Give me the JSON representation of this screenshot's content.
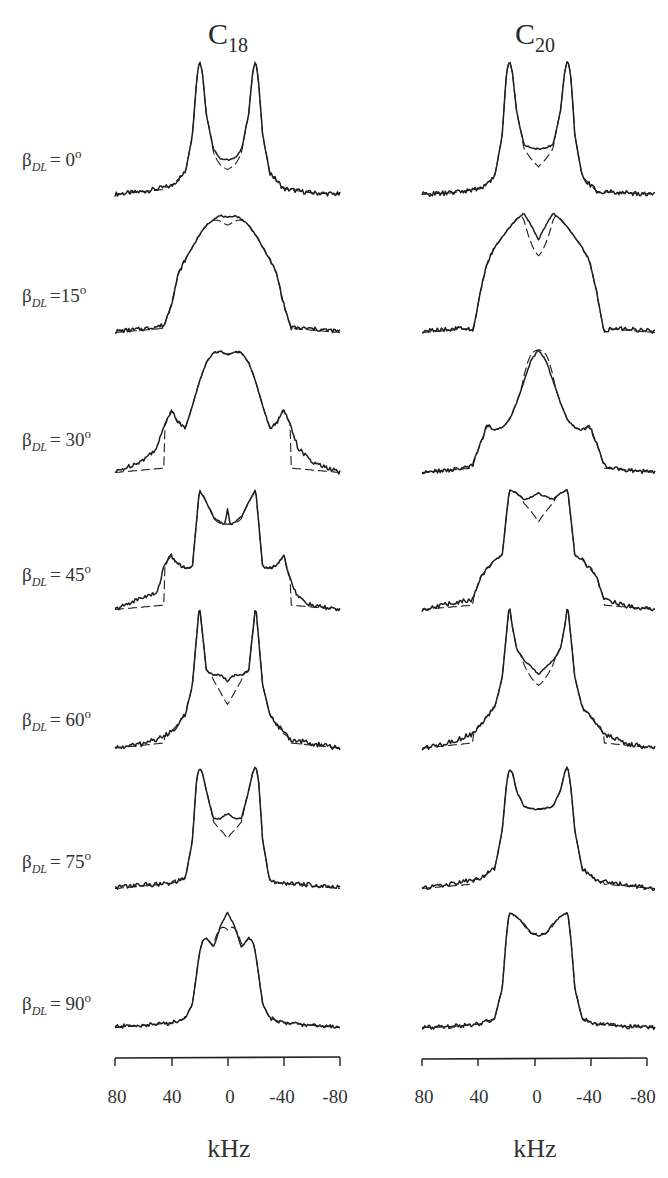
{
  "chart_data": {
    "type": "line",
    "title": "",
    "xlabel": "kHz",
    "ylabel": "",
    "xlim": [
      80,
      -80
    ],
    "x_ticks": [
      80,
      40,
      0,
      -40,
      -80
    ],
    "x_tick_labels": [
      "80",
      "40",
      "0",
      "-40",
      "-80"
    ],
    "grid": false,
    "legend": null,
    "columns": [
      {
        "id": "C18",
        "label": "C",
        "subscript": "18"
      },
      {
        "id": "C20",
        "label": "C",
        "subscript": "20"
      }
    ],
    "rows": [
      {
        "angle": 0,
        "label": "β",
        "subscript": "DL",
        "text": "= 0",
        "unit": "o"
      },
      {
        "angle": 15,
        "label": "β",
        "subscript": "DL",
        "text": "=15",
        "unit": "o"
      },
      {
        "angle": 30,
        "label": "β",
        "subscript": "DL",
        "text": "= 30",
        "unit": "o"
      },
      {
        "angle": 45,
        "label": "β",
        "subscript": "DL",
        "text": "= 45",
        "unit": "o"
      },
      {
        "angle": 60,
        "label": "β",
        "subscript": "DL",
        "text": "= 60",
        "unit": "o"
      },
      {
        "angle": 75,
        "label": "β",
        "subscript": "DL",
        "text": "= 75",
        "unit": "o"
      },
      {
        "angle": 90,
        "label": "β",
        "subscript": "DL",
        "text": "= 90",
        "unit": "o"
      }
    ],
    "series_note": "Each spectrum: x in kHz (80 to -80), y = normalized intensity (0 baseline, 1 max). Solid = experiment, dashed = simulation.",
    "spectra": {
      "C18": [
        {
          "angle": 0,
          "x": [
            80,
            60,
            40,
            30,
            25,
            22,
            20,
            18,
            15,
            10,
            5,
            0,
            -5,
            -10,
            -15,
            -18,
            -20,
            -22,
            -25,
            -30,
            -40,
            -60,
            -80
          ],
          "y": [
            0.02,
            0.04,
            0.08,
            0.18,
            0.45,
            0.85,
            1.0,
            0.92,
            0.6,
            0.35,
            0.28,
            0.27,
            0.28,
            0.35,
            0.6,
            0.92,
            1.0,
            0.85,
            0.45,
            0.18,
            0.06,
            0.03,
            0.02
          ],
          "sim_center": 0.2
        },
        {
          "angle": 15,
          "x": [
            80,
            60,
            45,
            40,
            35,
            30,
            25,
            20,
            15,
            10,
            5,
            0,
            -5,
            -10,
            -15,
            -20,
            -25,
            -30,
            -35,
            -40,
            -45,
            -60,
            -80
          ],
          "y": [
            0.03,
            0.05,
            0.08,
            0.25,
            0.5,
            0.62,
            0.72,
            0.82,
            0.9,
            0.95,
            0.98,
            0.96,
            0.98,
            0.95,
            0.9,
            0.82,
            0.72,
            0.62,
            0.5,
            0.25,
            0.06,
            0.05,
            0.03
          ],
          "sim_center": 0.9
        },
        {
          "angle": 30,
          "x": [
            80,
            60,
            50,
            45,
            40,
            35,
            30,
            25,
            20,
            15,
            10,
            5,
            0,
            -5,
            -10,
            -15,
            -20,
            -25,
            -30,
            -35,
            -40,
            -45,
            -50,
            -60,
            -80
          ],
          "y": [
            0.02,
            0.12,
            0.22,
            0.4,
            0.52,
            0.42,
            0.38,
            0.55,
            0.75,
            0.9,
            0.98,
            0.99,
            0.96,
            0.99,
            0.98,
            0.9,
            0.75,
            0.55,
            0.38,
            0.42,
            0.52,
            0.4,
            0.22,
            0.1,
            0.02
          ],
          "sim_center": 0.97
        },
        {
          "angle": 45,
          "x": [
            80,
            60,
            50,
            45,
            40,
            35,
            30,
            25,
            20,
            15,
            10,
            5,
            2,
            0,
            -2,
            -5,
            -10,
            -15,
            -20,
            -25,
            -30,
            -35,
            -40,
            -45,
            -50,
            -60,
            -80
          ],
          "y": [
            0.02,
            0.12,
            0.15,
            0.38,
            0.45,
            0.38,
            0.35,
            0.36,
            0.98,
            0.88,
            0.76,
            0.72,
            0.7,
            0.82,
            0.7,
            0.72,
            0.76,
            0.88,
            0.98,
            0.36,
            0.35,
            0.38,
            0.45,
            0.25,
            0.12,
            0.05,
            0.02
          ],
          "sim_center": 0.7
        },
        {
          "angle": 60,
          "x": [
            80,
            60,
            45,
            40,
            30,
            25,
            22,
            20,
            18,
            15,
            10,
            5,
            0,
            -5,
            -10,
            -15,
            -18,
            -20,
            -22,
            -25,
            -30,
            -40,
            -45,
            -60,
            -80
          ],
          "y": [
            0.02,
            0.05,
            0.1,
            0.13,
            0.25,
            0.45,
            0.78,
            1.0,
            0.82,
            0.55,
            0.52,
            0.52,
            0.48,
            0.52,
            0.52,
            0.55,
            0.82,
            1.0,
            0.78,
            0.45,
            0.25,
            0.12,
            0.08,
            0.05,
            0.02
          ],
          "sim_center": 0.32
        },
        {
          "angle": 75,
          "x": [
            80,
            60,
            40,
            30,
            25,
            22,
            20,
            18,
            15,
            10,
            5,
            0,
            -5,
            -10,
            -15,
            -18,
            -20,
            -22,
            -25,
            -30,
            -40,
            -60,
            -80
          ],
          "y": [
            0.03,
            0.05,
            0.06,
            0.1,
            0.4,
            0.9,
            0.98,
            0.95,
            0.8,
            0.58,
            0.58,
            0.62,
            0.58,
            0.58,
            0.8,
            0.95,
            1.0,
            0.9,
            0.4,
            0.08,
            0.06,
            0.05,
            0.03
          ],
          "sim_center": 0.42
        },
        {
          "angle": 90,
          "x": [
            80,
            60,
            40,
            30,
            25,
            20,
            18,
            15,
            10,
            5,
            0,
            -5,
            -10,
            -15,
            -18,
            -20,
            -25,
            -30,
            -40,
            -60,
            -80
          ],
          "y": [
            0.03,
            0.04,
            0.06,
            0.1,
            0.22,
            0.65,
            0.75,
            0.78,
            0.7,
            0.88,
            1.0,
            0.88,
            0.7,
            0.78,
            0.75,
            0.65,
            0.22,
            0.1,
            0.06,
            0.04,
            0.03
          ],
          "sim_center": 0.85
        }
      ],
      "C20": [
        {
          "angle": 0,
          "x": [
            80,
            60,
            40,
            30,
            25,
            22,
            20,
            18,
            15,
            10,
            5,
            0,
            -5,
            -10,
            -15,
            -18,
            -20,
            -22,
            -25,
            -30,
            -40,
            -60,
            -80
          ],
          "y": [
            0.02,
            0.03,
            0.06,
            0.15,
            0.45,
            0.9,
            1.0,
            0.92,
            0.62,
            0.38,
            0.36,
            0.35,
            0.36,
            0.38,
            0.62,
            0.92,
            1.0,
            0.9,
            0.45,
            0.15,
            0.04,
            0.03,
            0.02
          ],
          "sim_center": 0.22
        },
        {
          "angle": 15,
          "x": [
            80,
            60,
            50,
            45,
            40,
            35,
            30,
            25,
            20,
            15,
            10,
            5,
            0,
            -5,
            -10,
            -15,
            -20,
            -25,
            -30,
            -35,
            -40,
            -45,
            -50,
            -60,
            -80
          ],
          "y": [
            0.03,
            0.05,
            0.06,
            0.02,
            0.35,
            0.6,
            0.72,
            0.8,
            0.88,
            0.95,
            1.0,
            0.9,
            0.78,
            0.9,
            1.0,
            0.95,
            0.88,
            0.8,
            0.72,
            0.6,
            0.35,
            0.02,
            0.06,
            0.05,
            0.03
          ],
          "sim_center": 0.65
        },
        {
          "angle": 30,
          "x": [
            80,
            60,
            45,
            40,
            35,
            30,
            25,
            20,
            15,
            10,
            5,
            0,
            -5,
            -10,
            -15,
            -20,
            -25,
            -30,
            -35,
            -40,
            -45,
            -60,
            -80
          ],
          "y": [
            0.02,
            0.04,
            0.08,
            0.25,
            0.4,
            0.36,
            0.38,
            0.44,
            0.58,
            0.75,
            0.92,
            1.0,
            0.92,
            0.75,
            0.58,
            0.44,
            0.38,
            0.36,
            0.4,
            0.25,
            0.08,
            0.04,
            0.02
          ],
          "sim_center": 1.0
        },
        {
          "angle": 45,
          "x": [
            80,
            60,
            45,
            40,
            35,
            30,
            25,
            20,
            15,
            10,
            5,
            0,
            -5,
            -10,
            -15,
            -20,
            -25,
            -30,
            -35,
            -40,
            -45,
            -60,
            -80
          ],
          "y": [
            0.02,
            0.07,
            0.1,
            0.28,
            0.35,
            0.42,
            0.45,
            0.98,
            0.95,
            0.9,
            0.92,
            0.95,
            0.92,
            0.9,
            0.95,
            0.98,
            0.45,
            0.42,
            0.35,
            0.28,
            0.1,
            0.05,
            0.02
          ],
          "sim_center": 0.72
        },
        {
          "angle": 60,
          "x": [
            80,
            60,
            45,
            40,
            30,
            25,
            22,
            20,
            18,
            15,
            10,
            5,
            0,
            -5,
            -10,
            -15,
            -18,
            -20,
            -22,
            -25,
            -30,
            -40,
            -45,
            -60,
            -80
          ],
          "y": [
            0.02,
            0.06,
            0.12,
            0.18,
            0.3,
            0.5,
            0.8,
            1.0,
            0.85,
            0.7,
            0.62,
            0.58,
            0.52,
            0.58,
            0.62,
            0.7,
            0.85,
            1.0,
            0.8,
            0.5,
            0.3,
            0.18,
            0.12,
            0.05,
            0.02
          ],
          "sim_center": 0.45
        },
        {
          "angle": 75,
          "x": [
            80,
            60,
            40,
            30,
            25,
            22,
            20,
            18,
            15,
            10,
            5,
            0,
            -5,
            -10,
            -15,
            -18,
            -20,
            -22,
            -25,
            -30,
            -40,
            -60,
            -80
          ],
          "y": [
            0.02,
            0.06,
            0.1,
            0.18,
            0.48,
            0.85,
            0.98,
            0.95,
            0.8,
            0.68,
            0.66,
            0.65,
            0.66,
            0.68,
            0.8,
            0.95,
            1.0,
            0.85,
            0.48,
            0.18,
            0.08,
            0.05,
            0.02
          ],
          "sim_center": 0.66
        },
        {
          "angle": 90,
          "x": [
            80,
            60,
            40,
            30,
            25,
            22,
            20,
            15,
            10,
            5,
            0,
            -5,
            -10,
            -15,
            -20,
            -22,
            -25,
            -30,
            -40,
            -60,
            -80
          ],
          "y": [
            0.02,
            0.03,
            0.05,
            0.1,
            0.35,
            0.8,
            1.0,
            0.96,
            0.9,
            0.82,
            0.8,
            0.82,
            0.9,
            0.96,
            1.0,
            0.8,
            0.35,
            0.1,
            0.05,
            0.03,
            0.02
          ],
          "sim_center": 0.82
        }
      ]
    }
  },
  "labels": {
    "col_c18_main": "C",
    "col_c18_sub": "18",
    "col_c20_main": "C",
    "col_c20_sub": "20",
    "beta": "β",
    "beta_sub": "DL",
    "degree": "o",
    "row_0": "= 0",
    "row_15": "=15",
    "row_30": "= 30",
    "row_45": "= 45",
    "row_60": "= 60",
    "row_75": "= 75",
    "row_90": "= 90",
    "tick_80": "80",
    "tick_40": "40",
    "tick_0": "0",
    "tick_m40": "-40",
    "tick_m80": "-80",
    "unit": "kHz"
  }
}
